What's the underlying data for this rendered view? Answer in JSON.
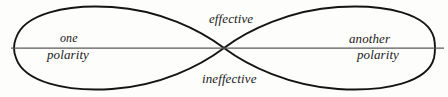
{
  "diagram": {
    "name": "polarity-lemniscate",
    "type": "figure-eight-polarity-diagram",
    "background_color": "#fdfdfc",
    "curve_color": "#141414",
    "axis_color": "#5a5a5a",
    "text_color": "#1a1a1a",
    "labels": {
      "top_center": "effective",
      "bottom_center": "ineffective",
      "left_upper": "one",
      "left_lower": "polarity",
      "right_upper": "another",
      "right_lower": "polarity"
    },
    "geometry": {
      "crossing_point": {
        "x": 224,
        "y": 48
      },
      "left_lobe_tip_x": 15,
      "right_lobe_tip_x": 434,
      "lobe_top_y": 7,
      "lobe_bottom_y": 89,
      "axis_y": 48,
      "axis_start_x": 11,
      "axis_end_x": 444
    }
  }
}
